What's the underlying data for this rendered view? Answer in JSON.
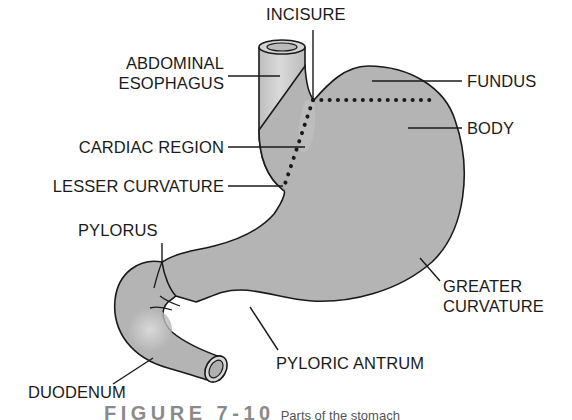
{
  "diagram": {
    "title": "Parts of the stomach",
    "labels": {
      "incisure": "INCISURE",
      "abdominal_esophagus_line1": "ABDOMINAL",
      "abdominal_esophagus_line2": "ESOPHAGUS",
      "fundus": "FUNDUS",
      "body": "BODY",
      "cardiac_region": "CARDIAC REGION",
      "lesser_curvature": "LESSER CURVATURE",
      "pylorus": "PYLORUS",
      "greater_curvature_line1": "GREATER",
      "greater_curvature_line2": "CURVATURE",
      "pyloric_antrum": "PYLORIC ANTRUM",
      "duodenum": "DUODENUM"
    },
    "caption": {
      "figure": "FIGURE 7-10",
      "text": "Parts of the stomach"
    },
    "colors": {
      "stomach_fill": "#b4b4b4",
      "esophagus_fill": "#c8c8c8",
      "outline": "#1a1a1a",
      "background": "#ffffff"
    }
  }
}
